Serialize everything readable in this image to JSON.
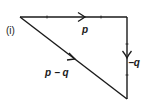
{
  "diagram": {
    "part_label": "(i)",
    "vectors": [
      {
        "name": "p",
        "label": "p",
        "from": [
          20,
          17
        ],
        "to": [
          127,
          17
        ],
        "direction": "right"
      },
      {
        "name": "-q",
        "label": "−q",
        "from": [
          127,
          17
        ],
        "to": [
          127,
          99
        ],
        "direction": "down"
      },
      {
        "name": "p-q",
        "label": "p − q",
        "from": [
          20,
          17
        ],
        "to": [
          127,
          99
        ],
        "direction": "down-right"
      }
    ],
    "line_color": "#1a1a1a",
    "background": "#ffffff"
  }
}
